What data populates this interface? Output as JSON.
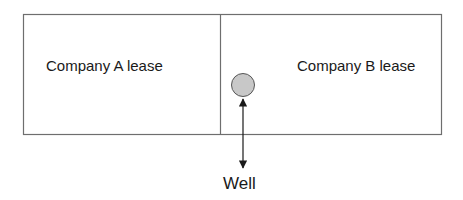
{
  "diagram": {
    "lease_a": {
      "label": "Company A lease"
    },
    "lease_b": {
      "label": "Company B lease"
    },
    "well": {
      "label": "Well",
      "fill": "#c8c8c8",
      "stroke": "#555555"
    },
    "colors": {
      "border": "#6e6e6e",
      "arrow": "#1a1a1a",
      "text": "#1a1a1a"
    }
  }
}
